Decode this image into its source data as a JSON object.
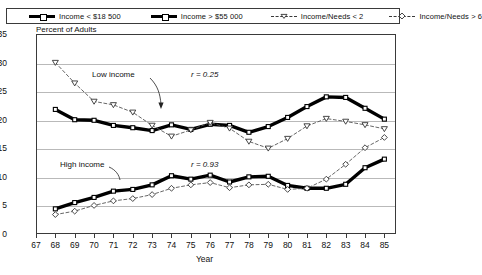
{
  "legend": {
    "items": [
      {
        "label": "Income < $18 500",
        "marker": "thick-line-square",
        "style": "solid-thick"
      },
      {
        "label": "Income > $55 000",
        "marker": "thick-line-square",
        "style": "solid-thick"
      },
      {
        "label": "Income/Needs < 2",
        "marker": "triangle-down",
        "style": "dashed-thin"
      },
      {
        "label": "Income/Needs > 6",
        "marker": "diamond",
        "style": "dashed-thin"
      }
    ]
  },
  "annotations": {
    "low_income": "Low income",
    "high_income": "High income",
    "r_low": "r = 0.25",
    "r_high": "r = 0.93"
  },
  "chart_data": {
    "type": "line",
    "title": "",
    "xlabel": "Year",
    "ylabel": "Percent of Adults",
    "ylim": [
      0,
      35
    ],
    "yticks": [
      0,
      5,
      10,
      15,
      20,
      25,
      30,
      35
    ],
    "xlim": [
      67,
      85.6
    ],
    "x": [
      68,
      69,
      70,
      71,
      72,
      73,
      74,
      75,
      76,
      77,
      78,
      79,
      80,
      81,
      82,
      83,
      84,
      85
    ],
    "xticks": [
      67,
      68,
      69,
      70,
      71,
      72,
      73,
      74,
      75,
      76,
      77,
      78,
      79,
      80,
      81,
      82,
      83,
      84,
      85
    ],
    "grid": true,
    "legend_position": "top",
    "series": [
      {
        "name": "Income < $18 500",
        "marker": "square",
        "style": "solid-thick",
        "values": [
          21.8,
          20.0,
          19.9,
          19.0,
          18.6,
          18.1,
          19.1,
          18.3,
          19.2,
          19.0,
          17.8,
          18.8,
          20.4,
          22.3,
          24.0,
          23.9,
          22.0,
          20.1
        ]
      },
      {
        "name": "Income > $55 000",
        "marker": "square",
        "style": "solid-thick",
        "values": [
          4.4,
          5.5,
          6.4,
          7.5,
          7.8,
          8.6,
          10.2,
          9.6,
          10.3,
          9.1,
          10.0,
          10.1,
          8.5,
          8.0,
          8.0,
          8.7,
          11.6,
          13.1
        ]
      },
      {
        "name": "Income/Needs < 2",
        "marker": "triangle-down",
        "style": "dashed-thin",
        "values": [
          30.0,
          26.4,
          23.2,
          22.6,
          21.3,
          19.0,
          17.1,
          18.2,
          19.5,
          18.5,
          16.2,
          15.0,
          16.7,
          18.9,
          20.2,
          19.7,
          19.1,
          18.4
        ]
      },
      {
        "name": "Income/Needs > 6",
        "marker": "diamond",
        "style": "dashed-thin",
        "values": [
          3.4,
          4.0,
          5.0,
          5.8,
          6.2,
          6.9,
          8.0,
          8.6,
          9.0,
          8.1,
          8.6,
          8.7,
          7.8,
          8.0,
          9.6,
          12.2,
          15.1,
          16.9
        ]
      }
    ]
  }
}
